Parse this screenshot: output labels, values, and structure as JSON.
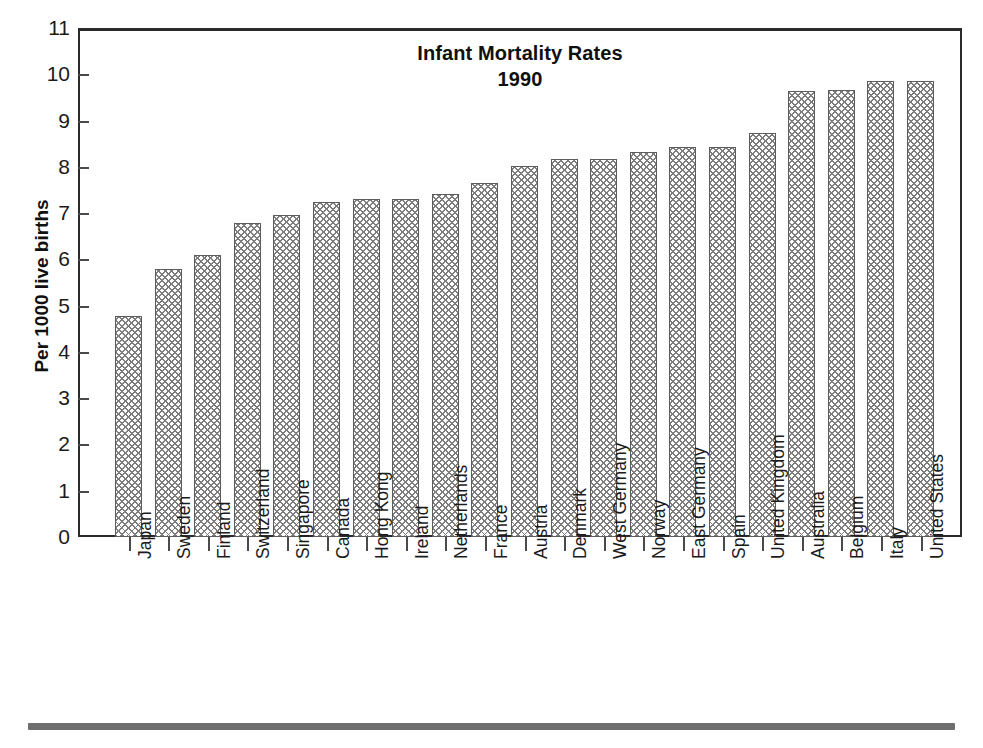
{
  "chart_data": {
    "type": "bar",
    "title": "Infant Mortality Rates",
    "subtitle": "1990",
    "xlabel": "",
    "ylabel": "Per 1000 live births",
    "ylim": [
      0,
      11
    ],
    "ytick_values": [
      0,
      1,
      2,
      3,
      4,
      5,
      6,
      7,
      8,
      9,
      10,
      11
    ],
    "ytick_labels": [
      "0",
      "1",
      "2",
      "3",
      "4",
      "5",
      "6",
      "7",
      "8",
      "9",
      "10",
      "11"
    ],
    "grid": false,
    "legend": "none",
    "categories": [
      "Japan",
      "Sweden",
      "Finland",
      "Switzerland",
      "Singapore",
      "Canada",
      "Hong Kong",
      "Ireland",
      "Netherlands",
      "France",
      "Austria",
      "Denmark",
      "West Germany",
      "Norway",
      "East Germany",
      "Spain",
      "United Kingdom",
      "Australia",
      "Belgium",
      "Italy",
      "United States"
    ],
    "values": [
      4.77,
      5.79,
      6.1,
      6.78,
      6.95,
      7.23,
      7.3,
      7.3,
      7.42,
      7.64,
      8.01,
      8.16,
      8.16,
      8.31,
      8.42,
      8.42,
      8.73,
      9.63,
      9.65,
      9.86,
      9.86
    ]
  },
  "footer": {
    "rule": "decorative-rule"
  }
}
